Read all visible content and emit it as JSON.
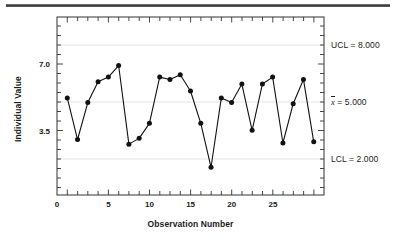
{
  "chart_data": {
    "type": "line",
    "title": "",
    "subtitle": "",
    "xlabel": "Observation Number",
    "ylabel": "Individual Value",
    "xlim": [
      0,
      26
    ],
    "ylim": [
      1.1,
      8.8
    ],
    "grid": "horizontal gridlines at control limits only",
    "legend": "none",
    "x": [
      1,
      2,
      3,
      4,
      5,
      6,
      7,
      8,
      9,
      10,
      11,
      12,
      13,
      14,
      15,
      16,
      17,
      18,
      19,
      20,
      21,
      22,
      23,
      24,
      25
    ],
    "series": [
      {
        "name": "Individual Value",
        "values": [
          5.3,
          3.5,
          5.1,
          6.0,
          6.2,
          6.7,
          3.3,
          3.55,
          4.2,
          6.2,
          6.1,
          6.3,
          5.6,
          4.2,
          2.3,
          5.3,
          5.1,
          5.9,
          3.9,
          5.9,
          6.2,
          3.35,
          5.05,
          6.1,
          3.4
        ],
        "marker": "filled-circle",
        "color": "#111111"
      }
    ],
    "reference_lines": [
      {
        "name": "UCL",
        "label": "UCL = 8.000",
        "value": 8.0,
        "color": "#e8e8e8"
      },
      {
        "name": "center",
        "label": "x̄ = 5.000",
        "value": 5.0,
        "color": "#e8e8e8"
      },
      {
        "name": "LCL",
        "label": "LCL = 2.000",
        "value": 2.0,
        "color": "#e8e8e8"
      }
    ],
    "yticks": [
      {
        "value": 7.0,
        "label": "7.0"
      },
      {
        "value": 3.5,
        "label": "3.5"
      }
    ],
    "xticks": [
      {
        "value": 0,
        "label": "0"
      },
      {
        "value": 5,
        "label": "5"
      },
      {
        "value": 10,
        "label": "10"
      },
      {
        "value": 15,
        "label": "15"
      },
      {
        "value": 20,
        "label": "20"
      },
      {
        "value": 25,
        "label": "25"
      }
    ]
  },
  "limits": {
    "ucl_label": "UCL = 8.000",
    "center_symbol": "x",
    "center_rest": " = 5.000",
    "lcl_label": "LCL = 2.000"
  },
  "axes": {
    "ylabel": "Individual Value",
    "xlabel": "Observation Number",
    "ytick_1": "7.0",
    "ytick_2": "3.5",
    "xtick_1": "0",
    "xtick_2": "5",
    "xtick_3": "10",
    "xtick_4": "15",
    "xtick_5": "20",
    "xtick_6": "25"
  }
}
